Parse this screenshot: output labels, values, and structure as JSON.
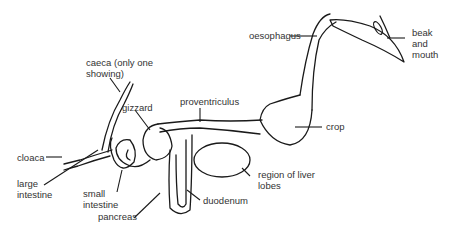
{
  "diagram": {
    "labels": {
      "oesophagus": "oesophagus",
      "beak_and_mouth": "beak\nand\nmouth",
      "caeca": "caeca (only one\nshowing)",
      "gizzard": "gizzard",
      "proventriculus": "proventriculus",
      "crop": "crop",
      "cloaca": "cloaca",
      "large_intestine": "large\nintestine",
      "small_intestine": "small\nintestine",
      "region_of_liver_lobes": "region of liver\nlobes",
      "pancreas": "pancreas",
      "duodenum": "duodenum"
    },
    "colors": {
      "line": "#1a1a1a",
      "text": "#333333",
      "background": "#ffffff"
    }
  }
}
